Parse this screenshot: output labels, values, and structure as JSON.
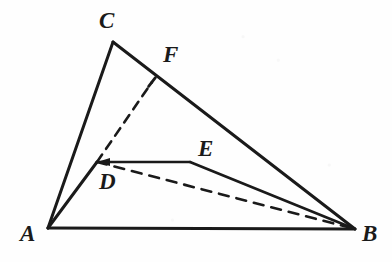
{
  "figure": {
    "kind": "geometry-diagram",
    "caption": "",
    "background_color": "#fefefe",
    "stroke_color": "#1a1a1a",
    "width": 392,
    "height": 262,
    "points": [
      {
        "id": "A",
        "label": "A",
        "x": 48,
        "y": 228,
        "label_x": 20,
        "label_y": 222
      },
      {
        "id": "B",
        "label": "B",
        "x": 355,
        "y": 229,
        "label_x": 362,
        "label_y": 222
      },
      {
        "id": "C",
        "label": "C",
        "x": 113,
        "y": 42,
        "label_x": 99,
        "label_y": 9
      },
      {
        "id": "D",
        "label": "D",
        "x": 97,
        "y": 162,
        "label_x": 99,
        "label_y": 170
      },
      {
        "id": "E",
        "label": "E",
        "x": 190,
        "y": 162,
        "label_x": 198,
        "label_y": 137
      },
      {
        "id": "F",
        "label": "F",
        "x": 152,
        "y": 82,
        "label_x": 163,
        "label_y": 43
      }
    ],
    "segments": [
      {
        "id": "AB",
        "from": "A",
        "to": "B",
        "style": "solid",
        "width": 3.0
      },
      {
        "id": "AC",
        "from": "A",
        "to": "C",
        "style": "solid",
        "width": 3.0
      },
      {
        "id": "CB",
        "from": "C",
        "to": "B",
        "style": "solid",
        "width": 3.0
      },
      {
        "id": "AD",
        "from": "A",
        "to": "D",
        "style": "solid",
        "width": 3.0
      },
      {
        "id": "DE",
        "from": "D",
        "to": "E",
        "style": "solid",
        "width": 2.6
      },
      {
        "id": "EB",
        "from": "E",
        "to": "B",
        "style": "solid",
        "width": 2.6
      },
      {
        "id": "DF",
        "from": "D",
        "to": "F",
        "style": "dashed",
        "width": 2.6,
        "dash": "9 7"
      },
      {
        "id": "DB",
        "from": "D",
        "to": "B",
        "style": "dashed",
        "width": 2.6,
        "dash": "10 8"
      }
    ],
    "marks": [
      {
        "id": "tick-F",
        "at": "F",
        "kind": "perpendicular-tick",
        "length": 11
      },
      {
        "id": "arrow-D",
        "at": "D",
        "kind": "arrowhead-left"
      }
    ]
  }
}
